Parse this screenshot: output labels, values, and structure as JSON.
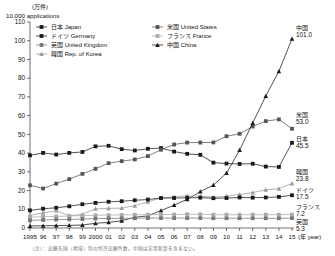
{
  "figure": {
    "unit_jp": "(万件)",
    "unit_en": "10,000 applications",
    "xaxis_unit": "(年 year)",
    "note": "（注）：出願先国（地域）別の特許出願件数。中国は実用新案を含まない。"
  },
  "legend": {
    "items": [
      {
        "key": "japan",
        "label": "日本 Japan",
        "color": "#1a1a1a",
        "marker": "square"
      },
      {
        "key": "germany",
        "label": "ドイツ Germany",
        "color": "#1a1a1a",
        "marker": "square"
      },
      {
        "key": "uk",
        "label": "英国 United Kingdom",
        "color": "#777777",
        "marker": "square"
      },
      {
        "key": "korea",
        "label": "韓国 Rep. of Korea",
        "color": "#9a9a9a",
        "marker": "triangle"
      },
      {
        "key": "us",
        "label": "米国 United States",
        "color": "#555555",
        "marker": "square"
      },
      {
        "key": "france",
        "label": "フランス France",
        "color": "#aaaaaa",
        "marker": "square"
      },
      {
        "key": "china",
        "label": "中国 China",
        "color": "#1a1a1a",
        "marker": "triangle"
      }
    ]
  },
  "end_labels": [
    {
      "key": "china",
      "name": "中国",
      "value": "101.0"
    },
    {
      "key": "us",
      "name": "米国",
      "value": "53.0"
    },
    {
      "key": "japan",
      "name": "日本",
      "value": "45.5"
    },
    {
      "key": "korea",
      "name": "韓国",
      "value": "23.8"
    },
    {
      "key": "germany",
      "name": "ドイツ",
      "value": "17.5"
    },
    {
      "key": "france",
      "name": "フランス",
      "value": "7.2"
    },
    {
      "key": "uk",
      "name": "英国",
      "value": "5.3"
    }
  ],
  "chart_data": {
    "type": "line",
    "title": "",
    "xlabel": "(年 year)",
    "ylabel": "10,000 applications",
    "ylim": [
      0,
      110
    ],
    "yticks": [
      0,
      10,
      20,
      30,
      40,
      50,
      60,
      70,
      80,
      90,
      100,
      110
    ],
    "ytick_labels": [
      "0",
      "10",
      "20",
      "30",
      "40",
      "50",
      "60",
      "70",
      "80",
      "90",
      "100",
      "110"
    ],
    "grid": false,
    "legend_position": "top",
    "x": [
      1995,
      1996,
      1997,
      1998,
      1999,
      2000,
      2001,
      2002,
      2003,
      2004,
      2005,
      2006,
      2007,
      2008,
      2009,
      2010,
      2011,
      2012,
      2013,
      2014,
      2015
    ],
    "xtick_labels": [
      "1995",
      "96",
      "97",
      "98",
      "99",
      "2000",
      "01",
      "02",
      "03",
      "04",
      "05",
      "06",
      "07",
      "08",
      "09",
      "10",
      "11",
      "12",
      "13",
      "14",
      "15"
    ],
    "series": [
      {
        "name": "日本 Japan",
        "key": "japan",
        "color": "#1a1a1a",
        "marker": "square",
        "values": [
          38.8,
          40.1,
          39.2,
          40.1,
          40.6,
          43.6,
          43.9,
          42.1,
          41.4,
          42.3,
          42.7,
          40.8,
          39.6,
          39.1,
          34.9,
          34.4,
          34.2,
          34.3,
          32.8,
          32.6,
          45.5
        ]
      },
      {
        "name": "米国 United States",
        "key": "us",
        "color": "#555555",
        "marker": "square",
        "values": [
          22.8,
          21.1,
          23.7,
          26.1,
          28.9,
          31.6,
          34.6,
          35.7,
          36.6,
          38.4,
          41.8,
          44.6,
          45.6,
          45.6,
          45.7,
          49.0,
          50.3,
          54.2,
          57.1,
          58.0,
          53.0
        ]
      },
      {
        "name": "中国 China",
        "key": "china",
        "color": "#1a1a1a",
        "marker": "triangle",
        "values": [
          1.1,
          1.2,
          1.3,
          1.4,
          1.6,
          2.5,
          3.0,
          3.9,
          5.7,
          6.5,
          9.3,
          12.2,
          15.3,
          19.4,
          22.9,
          29.3,
          41.6,
          56.1,
          70.5,
          83.7,
          101.0
        ]
      },
      {
        "name": "韓国 Rep. of Korea",
        "key": "korea",
        "color": "#9a9a9a",
        "marker": "triangle",
        "values": [
          6.8,
          8.1,
          9.3,
          6.5,
          7.3,
          10.2,
          10.5,
          10.6,
          11.9,
          14.0,
          16.1,
          16.6,
          17.2,
          17.0,
          16.4,
          17.0,
          17.9,
          18.9,
          20.4,
          21.0,
          23.8
        ]
      },
      {
        "name": "ドイツ Germany",
        "key": "germany",
        "color": "#1a1a1a",
        "marker": "square",
        "values": [
          9.4,
          10.3,
          10.8,
          11.6,
          12.7,
          13.4,
          14.0,
          14.3,
          14.8,
          15.2,
          16.0,
          16.0,
          16.1,
          16.2,
          15.9,
          16.0,
          16.3,
          16.2,
          16.3,
          16.6,
          17.5
        ]
      },
      {
        "name": "フランス France",
        "key": "france",
        "color": "#aaaaaa",
        "marker": "square",
        "values": [
          5.8,
          6.0,
          6.2,
          6.4,
          6.6,
          6.8,
          6.9,
          7.0,
          7.1,
          7.1,
          7.2,
          7.2,
          7.3,
          7.3,
          7.1,
          7.1,
          7.1,
          7.1,
          7.1,
          7.1,
          7.2
        ]
      },
      {
        "name": "英国 United Kingdom",
        "key": "uk",
        "color": "#777777",
        "marker": "square",
        "values": [
          4.1,
          4.3,
          4.5,
          4.6,
          4.8,
          5.0,
          5.1,
          5.2,
          5.2,
          5.3,
          5.3,
          5.3,
          5.3,
          5.3,
          5.2,
          5.2,
          5.2,
          5.2,
          5.2,
          5.2,
          5.3
        ]
      }
    ]
  }
}
